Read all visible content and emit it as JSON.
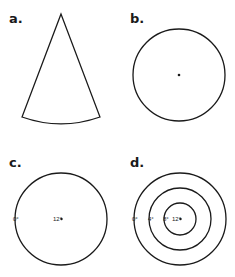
{
  "panels": {
    "a": {
      "label": "a.",
      "shape": "circular-sector"
    },
    "b": {
      "label": "b.",
      "shape": "circle-with-center-dot"
    },
    "c": {
      "label": "c.",
      "shape": "circle",
      "labels": {
        "edge": "0°",
        "center": "12°"
      }
    },
    "d": {
      "label": "d.",
      "shape": "concentric-circles",
      "labels": {
        "outer": "0°",
        "middle": "4°",
        "inner": "8°",
        "center": "12°"
      }
    }
  },
  "colors": {
    "line": "#1a1a1a",
    "background": "#ffffff"
  }
}
